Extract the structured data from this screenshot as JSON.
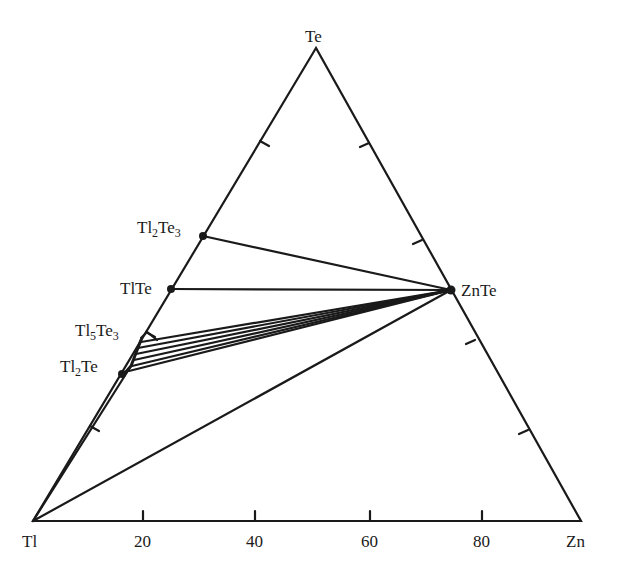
{
  "diagram": {
    "type": "ternary-phase-diagram",
    "vertices": {
      "top": {
        "label": "Te",
        "x": 316,
        "y": 48
      },
      "left": {
        "label": "Tl",
        "x": 33,
        "y": 521
      },
      "right": {
        "label": "Zn",
        "x": 581,
        "y": 521
      }
    },
    "base_axis_ticks": [
      "20",
      "40",
      "60",
      "80"
    ],
    "phases": [
      {
        "name": "Tl2Te3",
        "label_main": "Tl",
        "sub1": "2",
        "mid": "Te",
        "sub2": "3",
        "x": 203,
        "y": 236
      },
      {
        "name": "TlTe",
        "label_main": "TlTe",
        "x": 171,
        "y": 289
      },
      {
        "name": "Tl5Te3",
        "label_main": "Tl",
        "sub1": "5",
        "mid": "Te",
        "sub2": "3",
        "x": 141,
        "y": 338
      },
      {
        "name": "Tl2Te",
        "label_main": "Tl",
        "sub1": "2",
        "mid": "Te",
        "x": 122,
        "y": 374
      },
      {
        "name": "ZnTe",
        "label_main": "ZnTe",
        "x": 451,
        "y": 290
      }
    ],
    "line_color": "#1a1a1a"
  }
}
